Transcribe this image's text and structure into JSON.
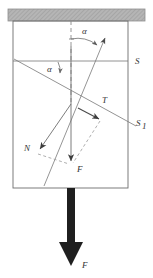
{
  "figure": {
    "canvas": {
      "width": 153,
      "height": 278
    },
    "colors": {
      "stroke": "#555555",
      "thin_stroke": "#777777",
      "hatch_fill": "#b3b3b3",
      "hatch_line": "#8c8c8c",
      "bold_arrow": "#1a1a1a",
      "label": "#333333",
      "background": "#ffffff"
    },
    "labels": {
      "angle_top": "α",
      "angle_left": "α",
      "line_s": "S",
      "line_s1": "S",
      "line_s1_sub": "1",
      "vector_t": "T",
      "vector_n": "N",
      "vector_f_inner": "F",
      "vector_f_outer": "F"
    },
    "ceiling": {
      "name": "hatched-ceiling",
      "x": 8,
      "y": 9,
      "width": 137,
      "height": 12
    },
    "body_box": {
      "name": "body-rectangle",
      "x": 13,
      "y": 21,
      "width": 115,
      "height": 167
    },
    "geometry": {
      "center": {
        "x": 71,
        "y": 104
      },
      "vertical_dashed": {
        "x1": 71,
        "y1": 21,
        "x2": 71,
        "y2": 104
      },
      "s_line": {
        "x1": 13,
        "y1": 61,
        "x2": 128,
        "y2": 61
      },
      "s1_line": {
        "x1": 13,
        "y1": 62,
        "x2": 135,
        "y2": 125
      },
      "t_vector": {
        "x1": 71,
        "y1": 104,
        "x2": 100,
        "y2": 118
      },
      "n_vector": {
        "x1": 71,
        "y1": 104,
        "x2": 37,
        "y2": 152
      },
      "f_inner_vector": {
        "x1": 71,
        "y1": 46,
        "x2": 71,
        "y2": 164
      },
      "upper_arrow": {
        "x1": 55,
        "y1": 170,
        "x2": 106,
        "y2": 38
      },
      "dashed_parallel_1": {
        "x1": 37,
        "y1": 155,
        "x2": 71,
        "y2": 165
      },
      "dashed_parallel_2": {
        "x1": 100,
        "y1": 120,
        "x2": 72,
        "y2": 164
      },
      "bold_arrow": {
        "x": 71,
        "y1": 188,
        "y2": 262
      }
    }
  }
}
